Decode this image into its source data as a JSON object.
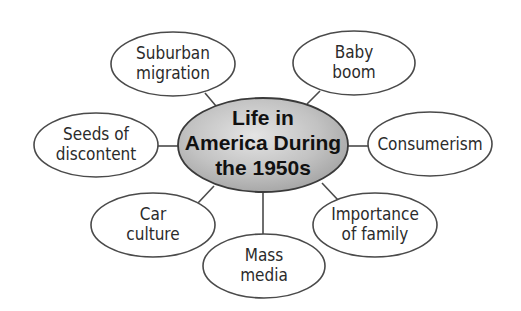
{
  "diagram": {
    "type": "concept-web",
    "center": {
      "lines": [
        "Life in",
        "America During",
        "the 1950s"
      ],
      "fill_color": "#b8b8b8",
      "gradient_light": "#e2e2e2",
      "gradient_dark": "#a4a4a4"
    },
    "nodes": [
      {
        "id": "suburban-migration",
        "lines": [
          "Suburban",
          "migration"
        ]
      },
      {
        "id": "baby-boom",
        "lines": [
          "Baby",
          "boom"
        ]
      },
      {
        "id": "seeds-of-discontent",
        "lines": [
          "Seeds of",
          "discontent"
        ]
      },
      {
        "id": "consumerism",
        "lines": [
          "Consumerism"
        ]
      },
      {
        "id": "car-culture",
        "lines": [
          "Car",
          "culture"
        ]
      },
      {
        "id": "importance-of-family",
        "lines": [
          "Importance",
          "of family"
        ]
      },
      {
        "id": "mass-media",
        "lines": [
          "Mass",
          "media"
        ]
      }
    ],
    "colors": {
      "stroke": "#4a4a4a",
      "node_fill": "#ffffff",
      "text": "#2b2b2b"
    }
  }
}
